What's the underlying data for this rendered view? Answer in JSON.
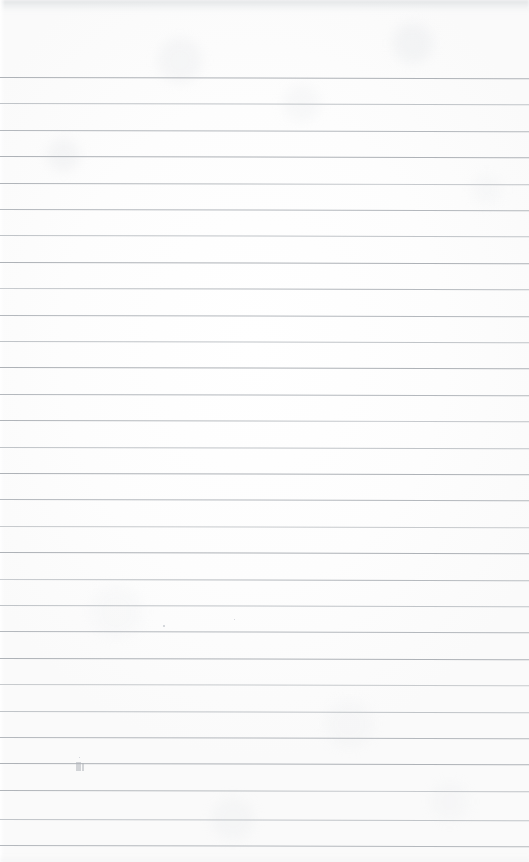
{
  "document": {
    "kind": "scanned-page",
    "title": "Blank ruled notebook page",
    "page_width_px": 529,
    "page_height_px": 862,
    "text_content": "",
    "has_handwriting": false,
    "has_printed_text": false
  },
  "paper": {
    "background_color": "#fefefe",
    "tint_color": "#fafafa",
    "edge_shadow_color": "#ced1d5"
  },
  "ruling": {
    "line_color": "#b7bbbf",
    "line_thickness_px": 1,
    "line_spacing_px": 26.4,
    "first_line_y_px": 77,
    "last_line_y_px": 845,
    "line_count": 30,
    "top_margin_px": 77,
    "left_margin_px": 0,
    "right_margin_px": 0,
    "skew_degrees": 0.13,
    "full_bleed": true,
    "lines": [
      {
        "y": 77,
        "shade": "d1"
      },
      {
        "y": 103.4,
        "shade": "d2"
      },
      {
        "y": 129.8,
        "shade": "d3"
      },
      {
        "y": 156.2,
        "shade": "d1"
      },
      {
        "y": 182.6,
        "shade": "fade-r"
      },
      {
        "y": 209.0,
        "shade": "d3"
      },
      {
        "y": 235.4,
        "shade": "d2"
      },
      {
        "y": 261.8,
        "shade": "d1"
      },
      {
        "y": 288.2,
        "shade": "fade-l"
      },
      {
        "y": 314.6,
        "shade": "d3"
      },
      {
        "y": 341.0,
        "shade": "d2"
      },
      {
        "y": 367.4,
        "shade": "d1"
      },
      {
        "y": 393.8,
        "shade": "d3"
      },
      {
        "y": 420.2,
        "shade": "fade-r"
      },
      {
        "y": 446.6,
        "shade": "d2"
      },
      {
        "y": 473.0,
        "shade": "d1"
      },
      {
        "y": 499.4,
        "shade": "d3"
      },
      {
        "y": 525.8,
        "shade": "d4"
      },
      {
        "y": 552.2,
        "shade": "d1"
      },
      {
        "y": 578.6,
        "shade": "fade-l"
      },
      {
        "y": 605.0,
        "shade": "d2"
      },
      {
        "y": 631.4,
        "shade": "d3"
      },
      {
        "y": 657.8,
        "shade": "d1"
      },
      {
        "y": 684.2,
        "shade": "d4"
      },
      {
        "y": 710.6,
        "shade": "d2"
      },
      {
        "y": 737.0,
        "shade": "d3"
      },
      {
        "y": 763.4,
        "shade": "d1"
      },
      {
        "y": 789.8,
        "shade": "fade-r"
      },
      {
        "y": 819.0,
        "shade": "d2"
      },
      {
        "y": 845.0,
        "shade": "d3"
      }
    ]
  },
  "artifacts": {
    "specks": [
      {
        "x": 163,
        "y": 625,
        "size": 2
      },
      {
        "x": 234,
        "y": 619,
        "size": 1
      },
      {
        "x": 79,
        "y": 757,
        "size": 1
      }
    ],
    "smudges": [
      {
        "x": 76,
        "y": 762,
        "w": 5,
        "h": 9
      },
      {
        "x": 82,
        "y": 763,
        "w": 2,
        "h": 8
      }
    ]
  }
}
